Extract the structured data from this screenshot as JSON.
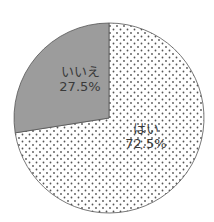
{
  "chart_data": {
    "type": "pie",
    "title": "",
    "categories": [
      "いいえ",
      "はい"
    ],
    "values": [
      27.5,
      72.5
    ],
    "labels": [
      "27.5%",
      "72.5%"
    ],
    "start_angle": "12 o'clock",
    "direction": "はい clockwise from top; いいえ counterclockwise from top",
    "fills": {
      "いいえ": {
        "color": "#9c9c9c",
        "pattern": "solid"
      },
      "はい": {
        "color": "#ffffff",
        "pattern": "dotted",
        "dot_color": "#555555"
      }
    },
    "legend": "none (inline labels)"
  },
  "slices": [
    {
      "name": "いいえ",
      "pct": "27.5%"
    },
    {
      "name": "はい",
      "pct": "72.5%"
    }
  ]
}
